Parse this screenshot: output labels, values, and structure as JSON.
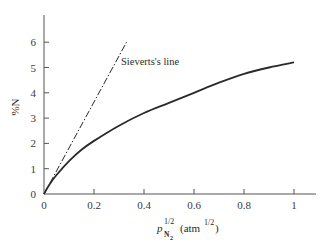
{
  "chart_data": {
    "type": "line",
    "title": "",
    "xlabel": "p_N2^1/2 (atm^1/2)",
    "xlabel_parts": {
      "symbol": "p",
      "sup": "1/2",
      "sub": "N",
      "subsub": "2",
      "unit_prefix": "(atm",
      "unit_sup": "1/2",
      "unit_suffix": ")"
    },
    "ylabel": "%N",
    "xlim": [
      0,
      1.08
    ],
    "ylim": [
      0,
      7
    ],
    "x_ticks": [
      0,
      0.2,
      0.4,
      0.6,
      0.8,
      1
    ],
    "x_tick_labels": [
      "0",
      "0.2",
      "0.4",
      "0.6",
      "0.8",
      "1"
    ],
    "y_ticks": [
      0,
      1,
      2,
      3,
      4,
      5,
      6
    ],
    "y_tick_labels": [
      "0",
      "1",
      "2",
      "3",
      "4",
      "5",
      "6"
    ],
    "grid": false,
    "legend": null,
    "series": [
      {
        "name": "%N (measured)",
        "style": "solid",
        "x": [
          0,
          0.02,
          0.05,
          0.1,
          0.15,
          0.2,
          0.3,
          0.4,
          0.5,
          0.6,
          0.7,
          0.8,
          0.9,
          1.0
        ],
        "y": [
          0,
          0.35,
          0.75,
          1.3,
          1.75,
          2.1,
          2.7,
          3.2,
          3.6,
          4.0,
          4.4,
          4.75,
          5.0,
          5.2
        ]
      },
      {
        "name": "Sieverts's line",
        "style": "dash-dot",
        "x": [
          0,
          0.33
        ],
        "y": [
          0,
          6
        ]
      }
    ],
    "annotations": [
      {
        "text": "Sieverts's line",
        "x": 0.31,
        "y": 5.25
      }
    ]
  }
}
